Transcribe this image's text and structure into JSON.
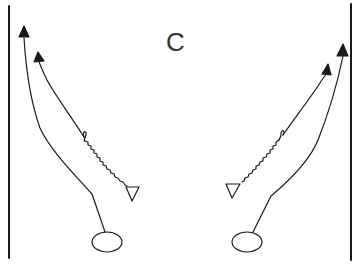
{
  "diagram": {
    "center_label": "C",
    "colors": {
      "ink": "#1a1a1a",
      "background": "#ffffff"
    },
    "sidelines": [
      {
        "side": "left",
        "x": 9
      },
      {
        "side": "right",
        "x": 351
      }
    ],
    "left_side": {
      "receivers": [
        {
          "route": "outer-arrow",
          "head": [
            24,
            30
          ]
        },
        {
          "route": "inner-arrow",
          "head": [
            39,
            56
          ]
        }
      ],
      "defender_symbol": "triangle",
      "player_symbol": "oval"
    },
    "right_side": {
      "receivers": [
        {
          "route": "outer-arrow",
          "head": [
            343,
            49
          ]
        },
        {
          "route": "inner-arrow",
          "head": [
            327,
            68
          ]
        }
      ],
      "defender_symbol": "triangle",
      "player_symbol": "oval"
    }
  }
}
